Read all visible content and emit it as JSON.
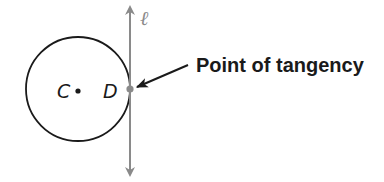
{
  "diagram": {
    "circle": {
      "center_label": "C",
      "center": [
        78,
        89
      ],
      "radius": 52,
      "stroke": "#1a1a1a"
    },
    "tangent_line": {
      "label": "ℓ",
      "x": 130,
      "y_top": 6,
      "y_bottom": 176,
      "color": "#8a8a8a"
    },
    "point_of_tangency": {
      "label": "D",
      "position": [
        130,
        89
      ],
      "color": "#8a8a8a"
    },
    "callout": {
      "text": "Point of tangency",
      "arrow_from": [
        188,
        65
      ],
      "arrow_to": [
        137,
        87
      ],
      "color": "#1a1a1a"
    }
  }
}
